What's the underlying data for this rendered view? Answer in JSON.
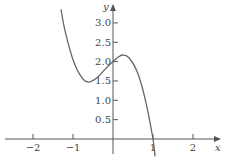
{
  "chart_data": {
    "type": "line",
    "title": "",
    "xlabel": "x",
    "ylabel": "y",
    "xlim": [
      -2.7,
      2.7
    ],
    "ylim": [
      -0.45,
      3.5
    ],
    "grid": false,
    "legend": null,
    "x_ticks": [
      "−2",
      "−1",
      "1",
      "2"
    ],
    "y_ticks": [
      "0.5",
      "1.0",
      "1.5",
      "2.0",
      "2.5",
      "3.0"
    ],
    "series": [
      {
        "name": "f(x)",
        "x": [
          -1.3,
          -1.2,
          -1.0,
          -0.8,
          -0.62,
          -0.4,
          -0.2,
          0.0,
          0.15,
          0.25,
          0.4,
          0.6,
          0.8,
          1.0,
          1.05
        ],
        "y": [
          3.35,
          2.8,
          2.05,
          1.62,
          1.47,
          1.58,
          1.8,
          2.0,
          2.13,
          2.17,
          2.1,
          1.75,
          1.05,
          0.0,
          -0.45
        ]
      }
    ],
    "annotations": {
      "local_min": [
        -0.62,
        1.47
      ],
      "local_max": [
        0.25,
        2.17
      ]
    }
  }
}
